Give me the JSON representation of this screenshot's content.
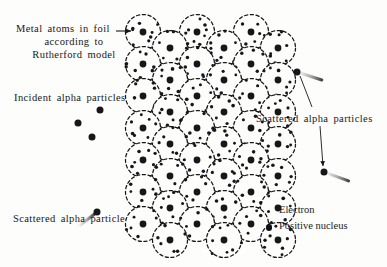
{
  "figure": {
    "background_color": "#fdfdfc",
    "ink_color": "#17171a"
  },
  "labels": {
    "metal_atoms_line1": "Metal atoms in foil",
    "metal_atoms_line2": "according to",
    "metal_atoms_line3": "Rutherford model",
    "incident": "Incident alpha particles",
    "scattered_single": "Scattered alpha particle",
    "scattered_plural": "Scattered alpha particles"
  },
  "legend": {
    "electron_label": "Electron",
    "nucleus_label": "Positive nucleus",
    "electron_dot_color": "#111113",
    "nucleus_dot_color": "#111113"
  },
  "diagram": {
    "atom_circle_radius": 17.5,
    "atom_stroke_dash": "3.2 2.6",
    "nucleus_radius": 3.4,
    "electron_radius": 1.35,
    "foil_rows": 8,
    "foil_columns_wide": 4,
    "foil_columns_narrow": 3,
    "atom_centers": [
      [
        143,
        32
      ],
      [
        197,
        32
      ],
      [
        251,
        32
      ],
      [
        170,
        48
      ],
      [
        224,
        48
      ],
      [
        278,
        48
      ],
      [
        143,
        64
      ],
      [
        197,
        64
      ],
      [
        251,
        64
      ],
      [
        170,
        80
      ],
      [
        224,
        80
      ],
      [
        278,
        80
      ],
      [
        143,
        96
      ],
      [
        197,
        96
      ],
      [
        251,
        96
      ],
      [
        170,
        112
      ],
      [
        224,
        112
      ],
      [
        278,
        112
      ],
      [
        143,
        128
      ],
      [
        197,
        128
      ],
      [
        251,
        128
      ],
      [
        170,
        144
      ],
      [
        224,
        144
      ],
      [
        278,
        144
      ],
      [
        143,
        160
      ],
      [
        197,
        160
      ],
      [
        251,
        160
      ],
      [
        170,
        176
      ],
      [
        224,
        176
      ],
      [
        278,
        176
      ],
      [
        143,
        192
      ],
      [
        197,
        192
      ],
      [
        251,
        192
      ],
      [
        170,
        208
      ],
      [
        224,
        208
      ],
      [
        278,
        208
      ],
      [
        143,
        224
      ],
      [
        197,
        224
      ],
      [
        251,
        224
      ],
      [
        170,
        240
      ],
      [
        224,
        240
      ],
      [
        278,
        240
      ]
    ],
    "incident_particles": [
      {
        "x": 100,
        "y": 110,
        "angle": 0,
        "trail": 13
      },
      {
        "x": 78,
        "y": 123,
        "angle": 0,
        "trail": 14
      },
      {
        "x": 92,
        "y": 137,
        "angle": 0,
        "trail": 13
      }
    ],
    "scattered_particles": [
      {
        "x": 97,
        "y": 212,
        "angle": -38,
        "trail": 22,
        "note": "lower-left deflected back"
      },
      {
        "x": 297,
        "y": 72,
        "angle": 198,
        "trail": 26,
        "note": "upper-right forward scatter"
      },
      {
        "x": 324,
        "y": 172,
        "angle": 200,
        "trail": 26,
        "note": "lower-right forward scatter"
      }
    ],
    "pointer_arrow": {
      "from_x": 116,
      "from_y": 31,
      "to_x": 131,
      "to_y": 31
    },
    "leader_lines": [
      {
        "x1": 300,
        "y1": 76,
        "x2": 312,
        "y2": 107,
        "arrow": false
      },
      {
        "x1": 320,
        "y1": 126,
        "x2": 323,
        "y2": 166,
        "arrow": true
      }
    ]
  }
}
